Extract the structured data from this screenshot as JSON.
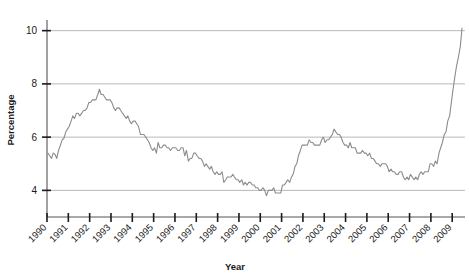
{
  "chart_data": {
    "type": "line",
    "title": "",
    "xlabel": "Year",
    "ylabel": "Percentage",
    "ylim": [
      3.0,
      10.4
    ],
    "xlim": [
      1990.0,
      2009.6
    ],
    "grid": true,
    "legend": "none",
    "y_ticks": [
      4,
      6,
      8,
      10
    ],
    "y_tick_labels": [
      "4",
      "6",
      "8",
      "10"
    ],
    "x_ticks": [
      1990,
      1991,
      1992,
      1993,
      1994,
      1995,
      1996,
      1997,
      1998,
      1999,
      2000,
      2001,
      2002,
      2003,
      2004,
      2005,
      2006,
      2007,
      2008,
      2009
    ],
    "x_tick_labels": [
      "1990",
      "1991",
      "1992",
      "1993",
      "1994",
      "1995",
      "1996",
      "1997",
      "1998",
      "1999",
      "2000",
      "2001",
      "2002",
      "2003",
      "2004",
      "2005",
      "2006",
      "2007",
      "2008",
      "2009"
    ],
    "series": [
      {
        "name": "Unemployment rate",
        "color": "#8c8c8c",
        "x": [
          1990.04,
          1990.13,
          1990.21,
          1990.29,
          1990.38,
          1990.46,
          1990.54,
          1990.63,
          1990.71,
          1990.79,
          1990.88,
          1990.96,
          1991.04,
          1991.13,
          1991.21,
          1991.29,
          1991.38,
          1991.46,
          1991.54,
          1991.63,
          1991.71,
          1991.79,
          1991.88,
          1991.96,
          1992.04,
          1992.13,
          1992.21,
          1992.29,
          1992.38,
          1992.46,
          1992.54,
          1992.63,
          1992.71,
          1992.79,
          1992.88,
          1992.96,
          1993.04,
          1993.13,
          1993.21,
          1993.29,
          1993.38,
          1993.46,
          1993.54,
          1993.63,
          1993.71,
          1993.79,
          1993.88,
          1993.96,
          1994.04,
          1994.13,
          1994.21,
          1994.29,
          1994.38,
          1994.46,
          1994.54,
          1994.63,
          1994.71,
          1994.79,
          1994.88,
          1994.96,
          1995.04,
          1995.13,
          1995.21,
          1995.29,
          1995.38,
          1995.46,
          1995.54,
          1995.63,
          1995.71,
          1995.79,
          1995.88,
          1995.96,
          1996.04,
          1996.13,
          1996.21,
          1996.29,
          1996.38,
          1996.46,
          1996.54,
          1996.63,
          1996.71,
          1996.79,
          1996.88,
          1996.96,
          1997.04,
          1997.13,
          1997.21,
          1997.29,
          1997.38,
          1997.46,
          1997.54,
          1997.63,
          1997.71,
          1997.79,
          1997.88,
          1997.96,
          1998.04,
          1998.13,
          1998.21,
          1998.29,
          1998.38,
          1998.46,
          1998.54,
          1998.63,
          1998.71,
          1998.79,
          1998.88,
          1998.96,
          1999.04,
          1999.13,
          1999.21,
          1999.29,
          1999.38,
          1999.46,
          1999.54,
          1999.63,
          1999.71,
          1999.79,
          1999.88,
          1999.96,
          2000.04,
          2000.13,
          2000.21,
          2000.29,
          2000.38,
          2000.46,
          2000.54,
          2000.63,
          2000.71,
          2000.79,
          2000.88,
          2000.96,
          2001.04,
          2001.13,
          2001.21,
          2001.29,
          2001.38,
          2001.46,
          2001.54,
          2001.63,
          2001.71,
          2001.79,
          2001.88,
          2001.96,
          2002.04,
          2002.13,
          2002.21,
          2002.29,
          2002.38,
          2002.46,
          2002.54,
          2002.63,
          2002.71,
          2002.79,
          2002.88,
          2002.96,
          2003.04,
          2003.13,
          2003.21,
          2003.29,
          2003.38,
          2003.46,
          2003.54,
          2003.63,
          2003.71,
          2003.79,
          2003.88,
          2003.96,
          2004.04,
          2004.13,
          2004.21,
          2004.29,
          2004.38,
          2004.46,
          2004.54,
          2004.63,
          2004.71,
          2004.79,
          2004.88,
          2004.96,
          2005.04,
          2005.13,
          2005.21,
          2005.29,
          2005.38,
          2005.46,
          2005.54,
          2005.63,
          2005.71,
          2005.79,
          2005.88,
          2005.96,
          2006.04,
          2006.13,
          2006.21,
          2006.29,
          2006.38,
          2006.46,
          2006.54,
          2006.63,
          2006.71,
          2006.79,
          2006.88,
          2006.96,
          2007.04,
          2007.13,
          2007.21,
          2007.29,
          2007.38,
          2007.46,
          2007.54,
          2007.63,
          2007.71,
          2007.79,
          2007.88,
          2007.96,
          2008.04,
          2008.13,
          2008.21,
          2008.29,
          2008.38,
          2008.46,
          2008.54,
          2008.63,
          2008.71,
          2008.79,
          2008.88,
          2008.96,
          2009.04,
          2009.13,
          2009.21,
          2009.29,
          2009.38,
          2009.46
        ],
        "values": [
          5.4,
          5.3,
          5.2,
          5.4,
          5.35,
          5.2,
          5.5,
          5.7,
          5.9,
          5.95,
          6.2,
          6.3,
          6.4,
          6.6,
          6.8,
          6.7,
          6.9,
          6.9,
          6.8,
          6.9,
          7.0,
          7.0,
          7.1,
          7.3,
          7.3,
          7.4,
          7.4,
          7.4,
          7.6,
          7.8,
          7.6,
          7.6,
          7.5,
          7.4,
          7.4,
          7.4,
          7.3,
          7.1,
          7.0,
          7.1,
          7.1,
          7.0,
          6.9,
          6.8,
          6.7,
          6.8,
          6.6,
          6.5,
          6.6,
          6.6,
          6.5,
          6.4,
          6.1,
          6.1,
          6.1,
          6.0,
          5.9,
          5.8,
          5.6,
          5.5,
          5.6,
          5.4,
          5.8,
          5.6,
          5.6,
          5.7,
          5.7,
          5.6,
          5.6,
          5.5,
          5.6,
          5.6,
          5.6,
          5.5,
          5.5,
          5.6,
          5.6,
          5.3,
          5.5,
          5.1,
          5.2,
          5.2,
          5.4,
          5.4,
          5.3,
          5.2,
          5.2,
          5.1,
          4.9,
          5.0,
          4.9,
          4.8,
          4.9,
          4.7,
          4.6,
          4.7,
          4.6,
          4.6,
          4.7,
          4.3,
          4.4,
          4.5,
          4.5,
          4.5,
          4.6,
          4.5,
          4.4,
          4.4,
          4.3,
          4.4,
          4.2,
          4.3,
          4.2,
          4.3,
          4.3,
          4.2,
          4.2,
          4.1,
          4.1,
          4.0,
          4.0,
          4.1,
          4.0,
          3.8,
          4.0,
          4.0,
          4.0,
          4.1,
          3.9,
          3.9,
          3.9,
          3.9,
          4.2,
          4.2,
          4.3,
          4.4,
          4.3,
          4.5,
          4.6,
          4.9,
          5.0,
          5.3,
          5.5,
          5.7,
          5.7,
          5.7,
          5.7,
          5.9,
          5.8,
          5.8,
          5.7,
          5.7,
          5.7,
          5.7,
          5.9,
          6.0,
          5.8,
          5.9,
          5.9,
          6.0,
          6.1,
          6.3,
          6.2,
          6.1,
          6.1,
          6.0,
          5.8,
          5.7,
          5.7,
          5.6,
          5.8,
          5.6,
          5.6,
          5.6,
          5.4,
          5.4,
          5.4,
          5.5,
          5.4,
          5.4,
          5.3,
          5.4,
          5.2,
          5.2,
          5.1,
          5.0,
          5.0,
          4.9,
          5.0,
          5.0,
          5.0,
          4.9,
          4.7,
          4.8,
          4.7,
          4.7,
          4.6,
          4.6,
          4.7,
          4.7,
          4.5,
          4.4,
          4.5,
          4.4,
          4.6,
          4.5,
          4.4,
          4.5,
          4.4,
          4.6,
          4.7,
          4.6,
          4.7,
          4.7,
          4.7,
          5.0,
          5.0,
          4.9,
          5.1,
          5.0,
          5.4,
          5.6,
          5.8,
          6.1,
          6.2,
          6.6,
          6.8,
          7.3,
          7.8,
          8.3,
          8.7,
          9.0,
          9.4,
          10.1
        ]
      }
    ]
  },
  "axes": {
    "y_axis_title": "Percentage",
    "x_axis_title": "Year"
  },
  "colors": {
    "line": "#8c8c8c",
    "grid": "#9a9a9a",
    "axis": "#555555",
    "text": "#1a1a1a",
    "background": "#ffffff"
  }
}
